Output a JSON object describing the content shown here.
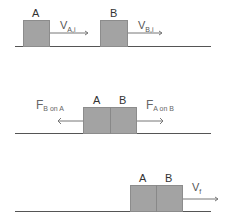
{
  "scenes": [
    {
      "name": "before-collision",
      "blocks": [
        {
          "label": "A"
        },
        {
          "label": "B"
        }
      ],
      "velocities": [
        {
          "symbol": "V",
          "subscript": "A,i"
        },
        {
          "symbol": "V",
          "subscript": "B,i"
        }
      ]
    },
    {
      "name": "during-collision",
      "blocks": [
        {
          "label": "A"
        },
        {
          "label": "B"
        }
      ],
      "forces": [
        {
          "symbol": "F",
          "subscript": "B on A",
          "direction": "left"
        },
        {
          "symbol": "F",
          "subscript": "A on B",
          "direction": "right"
        }
      ]
    },
    {
      "name": "after-collision",
      "blocks": [
        {
          "label": "A"
        },
        {
          "label": "B"
        }
      ],
      "velocities": [
        {
          "symbol": "V",
          "subscript": "f"
        }
      ]
    }
  ],
  "colors": {
    "block_fill": "#a3a3a3",
    "block_border": "#8c8c8c",
    "ground": "#555555",
    "arrow": "#777777"
  }
}
